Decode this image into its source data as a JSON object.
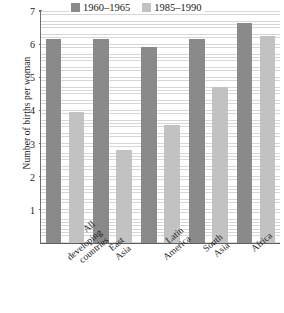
{
  "chart_data": {
    "type": "bar",
    "title": "",
    "xlabel": "",
    "ylabel": "Number of births per woman",
    "ylim": [
      0,
      7
    ],
    "yticks": [
      1,
      2,
      3,
      4,
      5,
      6,
      7
    ],
    "grid": true,
    "legend_position": "top",
    "categories": [
      "All developing countries",
      "East Asia",
      "Latin America",
      "South Asia",
      "Africa"
    ],
    "category_lines": [
      [
        "All",
        "developing",
        "countries"
      ],
      [
        "East",
        "Asia"
      ],
      [
        "Latin",
        "America"
      ],
      [
        "South",
        "Asia"
      ],
      [
        "Africa"
      ]
    ],
    "series": [
      {
        "name": "1960–1965",
        "color": "#8a8a8a",
        "values": [
          6.15,
          6.15,
          5.9,
          6.15,
          6.65
        ]
      },
      {
        "name": "1985–1990",
        "color": "#c2c2c2",
        "values": [
          3.95,
          2.8,
          3.55,
          4.7,
          6.25
        ]
      }
    ]
  }
}
